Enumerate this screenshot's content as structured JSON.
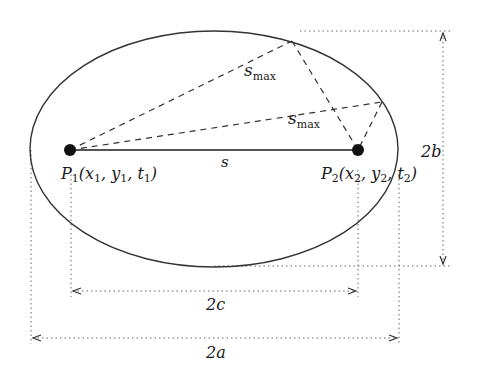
{
  "diagram": {
    "colors": {
      "ink": "#1a1a1a",
      "dashed": "#333333",
      "dotted": "#666666",
      "background": "#ffffff"
    },
    "ellipse": {
      "cx": 214,
      "cy": 149,
      "rx": 184,
      "ry": 118
    },
    "points": {
      "p1": {
        "x": 70,
        "y": 150,
        "label_main": "P",
        "label_sub": "1",
        "coords_text": "(x",
        "c_sub1": "1",
        "c_mid": ", y",
        "c_sub2": "1",
        "c_mid2": ", t",
        "c_sub3": "1",
        "c_end": ")"
      },
      "p2": {
        "x": 358,
        "y": 150,
        "label_main": "P",
        "label_sub": "2",
        "coords_text": "(x",
        "c_sub1": "2",
        "c_mid": ", y",
        "c_sub2": "2",
        "c_mid2": ", t",
        "c_sub3": "2",
        "c_end": ")"
      }
    },
    "ellipse_points": {
      "top_path": {
        "x": 292,
        "y": 41
      },
      "right_path": {
        "x": 382,
        "y": 102
      }
    },
    "labels": {
      "s": "s",
      "smax_1_main": "s",
      "smax_1_sub": "max",
      "smax_2_main": "s",
      "smax_2_sub": "max",
      "dim_2a": "2a",
      "dim_2b": "2b",
      "dim_2c": "2c"
    },
    "dimensions": {
      "2a": {
        "x1": 31,
        "x2": 399,
        "y": 338
      },
      "2c": {
        "x1": 71,
        "x2": 358,
        "y": 291
      },
      "2b": {
        "y1": 31,
        "y2": 266,
        "x": 443
      }
    }
  }
}
